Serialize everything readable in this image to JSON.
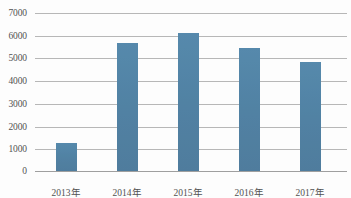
{
  "chart_data": {
    "type": "bar",
    "title": "",
    "subtitle": "",
    "xlabel": "",
    "ylabel": "",
    "categories": [
      "2013年",
      "2014年",
      "2015年",
      "2016年",
      "2017年"
    ],
    "values": [
      1250,
      5650,
      6100,
      5450,
      4830
    ],
    "series": [
      {
        "name": "",
        "values": [
          1250,
          5650,
          6100,
          5450,
          4830
        ]
      }
    ],
    "ylim": [
      0,
      7000
    ],
    "y_ticks": [
      0,
      1000,
      2000,
      3000,
      4000,
      5000,
      6000,
      7000
    ],
    "y_tick_labels": [
      "0",
      "1000",
      "2000",
      "3000",
      "4000",
      "5000",
      "6000",
      "7000"
    ],
    "grid": "horizontal",
    "legend": "none",
    "bar_color": "#2e6c95",
    "grid_color": "#a9a9a9",
    "axis_color": "#8c8c8c",
    "text_color": "#2b2b2b"
  },
  "caption": {
    "text": ""
  }
}
